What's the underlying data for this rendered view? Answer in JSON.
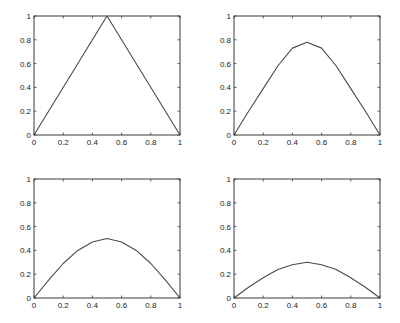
{
  "chart_data": [
    {
      "type": "line",
      "title": "",
      "xlabel": "",
      "ylabel": "",
      "xlim": [
        0,
        1
      ],
      "ylim": [
        0,
        1
      ],
      "grid": false,
      "x_ticks": [
        "0",
        "0.2",
        "0.4",
        "0.6",
        "0.8",
        "1"
      ],
      "y_ticks": [
        "0",
        "0.2",
        "0.4",
        "0.6",
        "0.8",
        "1"
      ],
      "x": [
        0,
        0.5,
        1
      ],
      "values": [
        0,
        1,
        0
      ]
    },
    {
      "type": "line",
      "title": "",
      "xlabel": "",
      "ylabel": "",
      "xlim": [
        0,
        1
      ],
      "ylim": [
        0,
        1
      ],
      "grid": false,
      "x_ticks": [
        "0",
        "0.2",
        "0.4",
        "0.6",
        "0.8",
        "1"
      ],
      "y_ticks": [
        "0",
        "0.2",
        "0.4",
        "0.6",
        "0.8",
        "1"
      ],
      "x": [
        0,
        0.1,
        0.2,
        0.3,
        0.4,
        0.5,
        0.6,
        0.7,
        0.8,
        0.9,
        1
      ],
      "values": [
        0,
        0.2,
        0.39,
        0.58,
        0.73,
        0.78,
        0.73,
        0.58,
        0.39,
        0.2,
        0
      ]
    },
    {
      "type": "line",
      "title": "",
      "xlabel": "",
      "ylabel": "",
      "xlim": [
        0,
        1
      ],
      "ylim": [
        0,
        1
      ],
      "grid": false,
      "x_ticks": [
        "0",
        "0.2",
        "0.4",
        "0.6",
        "0.8",
        "1"
      ],
      "y_ticks": [
        "0",
        "0.2",
        "0.4",
        "0.6",
        "0.8",
        "1"
      ],
      "x": [
        0,
        0.1,
        0.2,
        0.3,
        0.4,
        0.5,
        0.6,
        0.7,
        0.8,
        0.9,
        1
      ],
      "values": [
        0,
        0.15,
        0.29,
        0.4,
        0.47,
        0.5,
        0.47,
        0.4,
        0.29,
        0.15,
        0
      ]
    },
    {
      "type": "line",
      "title": "",
      "xlabel": "",
      "ylabel": "",
      "xlim": [
        0,
        1
      ],
      "ylim": [
        0,
        1
      ],
      "grid": false,
      "x_ticks": [
        "0",
        "0.2",
        "0.4",
        "0.6",
        "0.8",
        "1"
      ],
      "y_ticks": [
        "0",
        "0.2",
        "0.4",
        "0.6",
        "0.8",
        "1"
      ],
      "x": [
        0,
        0.1,
        0.2,
        0.3,
        0.4,
        0.5,
        0.6,
        0.7,
        0.8,
        0.9,
        1
      ],
      "values": [
        0,
        0.09,
        0.17,
        0.24,
        0.28,
        0.3,
        0.28,
        0.24,
        0.17,
        0.09,
        0
      ]
    }
  ],
  "layout": {
    "axes": [
      {
        "left": 34,
        "top": 16,
        "right": 180,
        "bottom": 135
      },
      {
        "left": 234,
        "top": 16,
        "right": 380,
        "bottom": 135
      },
      {
        "left": 34,
        "top": 179,
        "right": 180,
        "bottom": 298
      },
      {
        "left": 234,
        "top": 179,
        "right": 380,
        "bottom": 298
      }
    ]
  }
}
